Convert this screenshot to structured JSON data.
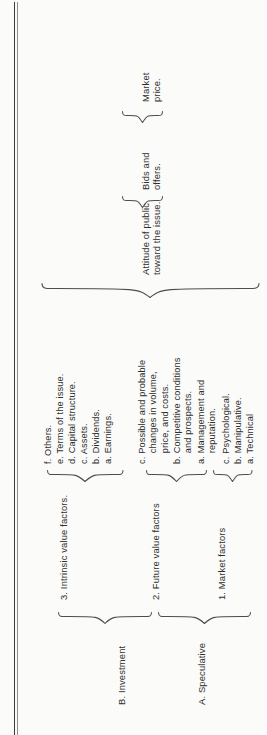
{
  "figure": {
    "kind": "bracket-tree-diagram",
    "orientation": "rotated-90-ccw",
    "ink_color": "#2e2e2e",
    "rule_color": "#4a4a4a",
    "paper_color": "#fbfbf9"
  },
  "root": {
    "label": "Market\nprice."
  },
  "level2": [
    {
      "label": "Attitude of public\ntoward the issue."
    },
    {
      "label": "Bids and\noffers."
    }
  ],
  "groups": [
    {
      "letter_label": "A. Speculative",
      "categories": [
        {
          "number_label": "1. Market factors",
          "items": [
            "a. Technical",
            "b. Manipulative.",
            "c. Psychological."
          ]
        },
        {
          "number_label": "2. Future value factors",
          "items": [
            "a. Management and\n    reputation.",
            "b. Competitive conditions\n    and prospects.",
            "c. Possible and probable\n    changes in volume,\n    price, and costs."
          ]
        }
      ]
    },
    {
      "letter_label": "B. Investment",
      "categories": [
        {
          "number_label": "3. Intrinsic value factors.",
          "items": [
            "a. Earnings.",
            "b. Dividends.",
            "c. Assets.",
            "d. Capital structure.",
            "e. Terms of the issue.",
            "f. Others."
          ]
        }
      ]
    }
  ]
}
